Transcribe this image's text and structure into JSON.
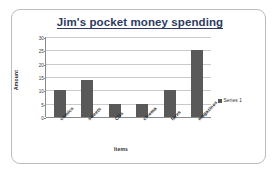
{
  "chart_data": {
    "type": "bar",
    "title": "Jim's pocket money spending",
    "xlabel": "Items",
    "ylabel": "Amount",
    "categories": [
      "comics",
      "sweets",
      "CDs",
      "cinema",
      "fares",
      "magazines"
    ],
    "values": [
      10,
      14,
      5,
      5,
      10,
      25
    ],
    "series": [
      {
        "name": "Series 1",
        "values": [
          10,
          14,
          5,
          5,
          10,
          25
        ]
      }
    ],
    "ylim": [
      0,
      30
    ],
    "yticks": [
      30,
      25,
      20,
      15,
      10,
      5,
      0
    ],
    "ytick_labels": [
      "30",
      "25",
      "20",
      "15",
      "10",
      "5",
      "0"
    ],
    "grid": true,
    "legend": {
      "position": "right",
      "entries": [
        {
          "label": "Series 1",
          "color": "#595959"
        }
      ]
    },
    "colors": {
      "bar": "#595959",
      "title": "#2d3b63",
      "gridline": "#c8cace",
      "axis": "#868b90",
      "frame": "#b9bcc0",
      "background": "#ffffff"
    }
  }
}
